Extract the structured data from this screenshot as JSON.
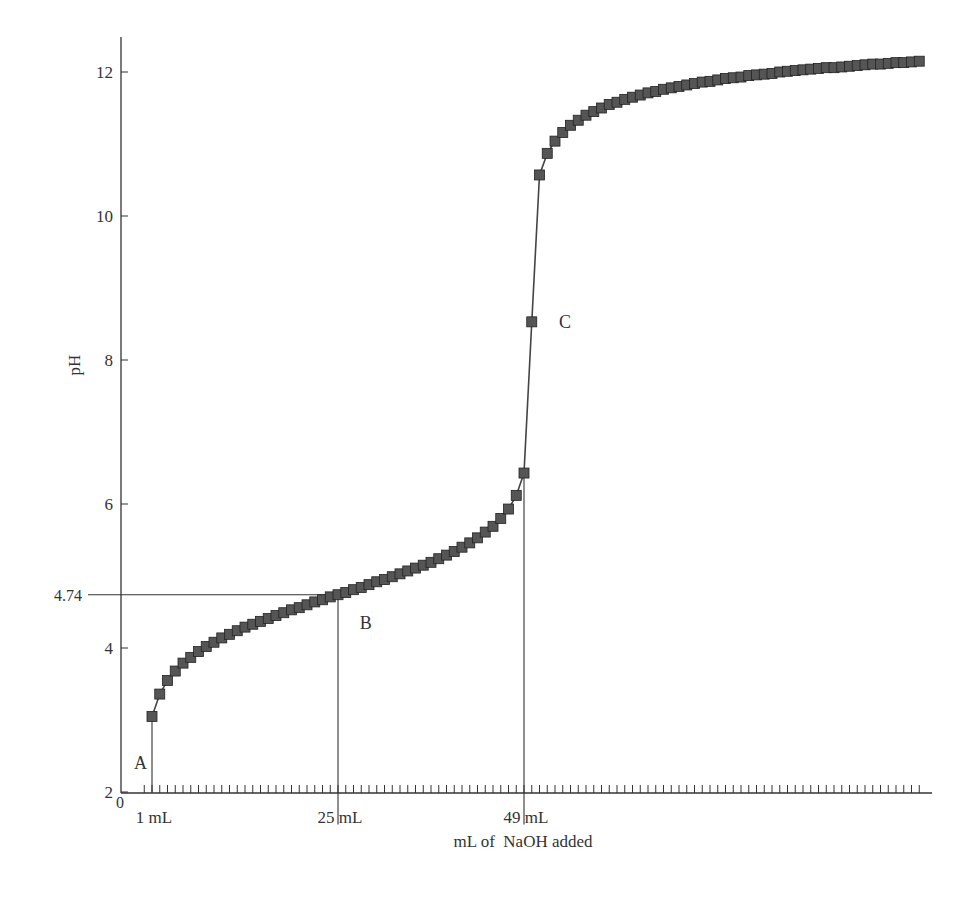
{
  "chart_data": {
    "type": "scatter",
    "title": "",
    "xlabel": "mL of  NaOH added",
    "ylabel": "pH",
    "ylim": [
      2,
      12.5
    ],
    "xlim": [
      0,
      101
    ],
    "grid": false,
    "legend": null,
    "y_ticks": [
      2,
      4,
      6,
      8,
      10,
      12
    ],
    "y_tick_labels": [
      "2",
      "4",
      "6",
      "8",
      "10",
      "12"
    ],
    "extra_y_label": "4.74",
    "x_origin_label": "0",
    "x_labeled_ticks": [
      {
        "value": 1,
        "label": "1 mL"
      },
      {
        "value": 25,
        "label": "25 mL"
      },
      {
        "value": 49,
        "label": "49 mL"
      }
    ],
    "minor_x_tick_every": 1,
    "annotations": [
      {
        "label": "A",
        "x": 1,
        "y": 2.4
      },
      {
        "label": "B",
        "x": 27.8,
        "y": 4.35
      },
      {
        "label": "C",
        "x": 53.5,
        "y": 8.53
      }
    ],
    "reference_lines": [
      {
        "type": "horizontal",
        "y": 4.74,
        "x_from": -4.3,
        "x_to": 25
      },
      {
        "type": "vertical",
        "x": 1,
        "y_from": 2,
        "y_to": 3.05
      },
      {
        "type": "vertical",
        "x": 25,
        "y_from": 1.55,
        "y_to": 4.74
      },
      {
        "type": "vertical",
        "x": 49,
        "y_from": 1.55,
        "y_to": 6.43
      }
    ],
    "series": [
      {
        "name": "Titration curve",
        "marker": "square",
        "marker_color": "#555555",
        "line_color": "#444444",
        "x": [
          1,
          2,
          3,
          4,
          5,
          6,
          7,
          8,
          9,
          10,
          11,
          12,
          13,
          14,
          15,
          16,
          17,
          18,
          19,
          20,
          21,
          22,
          23,
          24,
          25,
          26,
          27,
          28,
          29,
          30,
          31,
          32,
          33,
          34,
          35,
          36,
          37,
          38,
          39,
          40,
          41,
          42,
          43,
          44,
          45,
          46,
          47,
          48,
          49,
          50,
          51,
          52,
          53,
          54,
          55,
          56,
          57,
          58,
          59,
          60,
          61,
          62,
          63,
          64,
          65,
          66,
          67,
          68,
          69,
          70,
          71,
          72,
          73,
          74,
          75,
          76,
          77,
          78,
          79,
          80,
          81,
          82,
          83,
          84,
          85,
          86,
          87,
          88,
          89,
          90,
          91,
          92,
          93,
          94,
          95,
          96,
          97,
          98,
          99,
          100
        ],
        "values": [
          3.05,
          3.36,
          3.55,
          3.68,
          3.79,
          3.87,
          3.95,
          4.02,
          4.08,
          4.14,
          4.19,
          4.24,
          4.29,
          4.33,
          4.37,
          4.41,
          4.45,
          4.49,
          4.53,
          4.56,
          4.6,
          4.64,
          4.67,
          4.71,
          4.74,
          4.77,
          4.81,
          4.84,
          4.88,
          4.92,
          4.95,
          4.99,
          5.03,
          5.07,
          5.11,
          5.15,
          5.19,
          5.24,
          5.29,
          5.34,
          5.4,
          5.46,
          5.53,
          5.61,
          5.69,
          5.8,
          5.93,
          6.12,
          6.43,
          8.53,
          10.57,
          10.87,
          11.04,
          11.16,
          11.26,
          11.33,
          11.4,
          11.45,
          11.5,
          11.55,
          11.58,
          11.62,
          11.65,
          11.68,
          11.71,
          11.73,
          11.76,
          11.78,
          11.8,
          11.82,
          11.84,
          11.86,
          11.87,
          11.89,
          11.91,
          11.92,
          11.93,
          11.95,
          11.96,
          11.97,
          11.98,
          12.0,
          12.01,
          12.02,
          12.03,
          12.04,
          12.05,
          12.06,
          12.06,
          12.07,
          12.08,
          12.09,
          12.1,
          12.11,
          12.11,
          12.12,
          12.13,
          12.13,
          12.14,
          12.15
        ]
      }
    ]
  }
}
